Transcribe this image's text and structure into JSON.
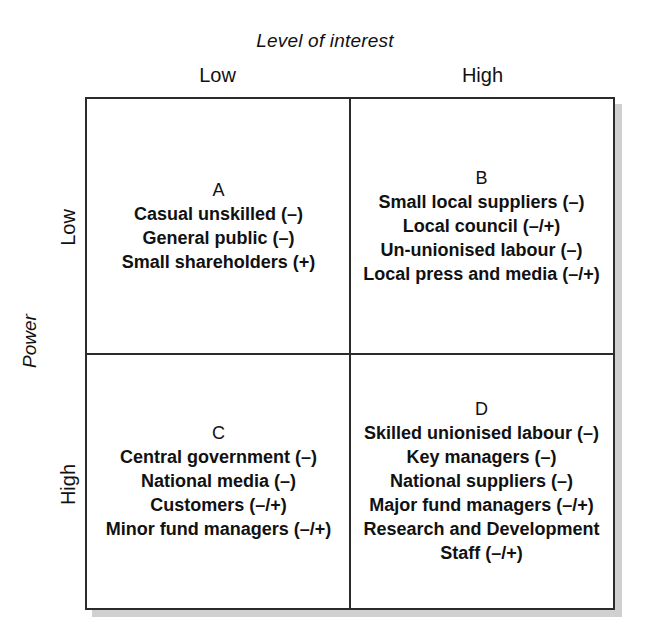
{
  "chart_data": {
    "type": "table",
    "xlabel": "Level of interest",
    "ylabel": "Power",
    "x_ticks": [
      "Low",
      "High"
    ],
    "y_ticks": [
      "Low",
      "High"
    ],
    "grid": true,
    "legend": null,
    "quadrants": [
      {
        "key": "A",
        "label": "A",
        "power": "Low",
        "interest": "Low",
        "items": [
          "Casual unskilled (–)",
          "General public (–)",
          "Small shareholders (+)"
        ]
      },
      {
        "key": "B",
        "label": "B",
        "power": "Low",
        "interest": "High",
        "items": [
          "Small local suppliers (–)",
          "Local council (–/+)",
          "Un-unionised labour (–)",
          "Local press and media (–/+)"
        ]
      },
      {
        "key": "C",
        "label": "C",
        "power": "High",
        "interest": "Low",
        "items": [
          "Central government (–)",
          "National media (–)",
          "Customers (–/+)",
          "Minor fund managers (–/+)"
        ]
      },
      {
        "key": "D",
        "label": "D",
        "power": "High",
        "interest": "High",
        "items": [
          "Skilled unionised labour (–)",
          "Key managers (–)",
          "National suppliers (–)",
          "Major fund managers (–/+)",
          "Research and Development",
          "Staff (–/+)"
        ]
      }
    ]
  },
  "axes": {
    "x_title": "Level of interest",
    "x_low": "Low",
    "x_high": "High",
    "y_title": "Power",
    "y_low": "Low",
    "y_high": "High"
  },
  "colors": {
    "frame": "#2b2b2b",
    "text": "#111111",
    "background": "#ffffff",
    "shadow": "#969696"
  }
}
